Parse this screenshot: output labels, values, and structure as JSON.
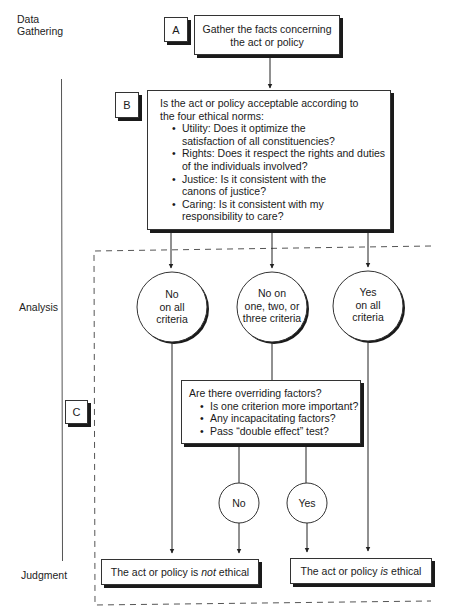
{
  "stages": {
    "data_gathering": [
      "Data",
      "Gathering"
    ],
    "analysis": "Analysis",
    "judgment": "Judgment"
  },
  "step_a": {
    "tag": "A",
    "text_lines": [
      "Gather the facts concerning",
      "the act or policy"
    ]
  },
  "step_b": {
    "tag": "B",
    "intro_lines": [
      "Is the act or policy acceptable according to",
      "the four ethical norms:"
    ],
    "norms": [
      {
        "lines": [
          "Utility: Does it optimize the",
          "satisfaction of all constituencies?"
        ]
      },
      {
        "lines": [
          "Rights: Does it respect the rights and duties",
          "of the individuals involved?"
        ]
      },
      {
        "lines": [
          "Justice: Is it consistent with the",
          "canons of justice?"
        ]
      },
      {
        "lines": [
          "Caring: Is it consistent with my",
          "responsibility to care?"
        ]
      }
    ]
  },
  "outcomes": [
    {
      "lines": [
        "No",
        "on all",
        "criteria"
      ]
    },
    {
      "lines": [
        "No on",
        "one, two, or",
        "three criteria"
      ]
    },
    {
      "lines": [
        "Yes",
        "on all",
        "criteria"
      ]
    }
  ],
  "step_c": {
    "tag": "C",
    "question": "Are there overriding factors?",
    "factors": [
      "Is one criterion more important?",
      "Any incapacitating factors?",
      "Pass “double effect” test?"
    ]
  },
  "override_answers": {
    "no": "No",
    "yes": "Yes"
  },
  "judgments": {
    "not_ethical": {
      "prefix": "The act or policy is ",
      "emphasis": "not",
      "suffix": " ethical"
    },
    "is_ethical": {
      "prefix": "The act or policy ",
      "emphasis": "is",
      "suffix": " ethical"
    }
  }
}
